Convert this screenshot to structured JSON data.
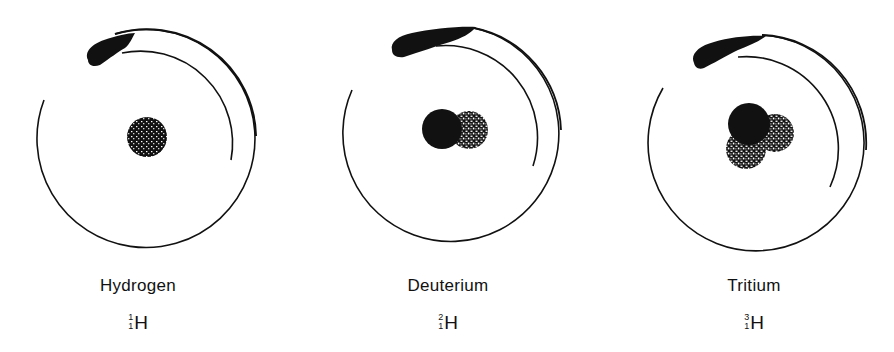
{
  "figure": {
    "type": "isotope-diagram",
    "colors": {
      "ink": "#111111",
      "background": "#ffffff"
    },
    "atoms": [
      {
        "name": "Hydrogen",
        "element": "H",
        "mass_number": "1",
        "atomic_number": "1",
        "nucleons": [
          {
            "kind": "proton",
            "style": "speckled-dark"
          }
        ]
      },
      {
        "name": "Deuterium",
        "element": "H",
        "mass_number": "2",
        "atomic_number": "1",
        "nucleons": [
          {
            "kind": "proton",
            "style": "solid"
          },
          {
            "kind": "neutron",
            "style": "speckled"
          }
        ]
      },
      {
        "name": "Tritium",
        "element": "H",
        "mass_number": "3",
        "atomic_number": "1",
        "nucleons": [
          {
            "kind": "proton",
            "style": "solid"
          },
          {
            "kind": "neutron",
            "style": "speckled"
          },
          {
            "kind": "neutron",
            "style": "speckled"
          }
        ]
      }
    ]
  }
}
